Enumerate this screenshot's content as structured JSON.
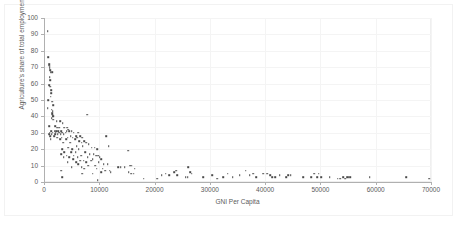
{
  "chart_data": {
    "type": "scatter",
    "title": "",
    "xlabel": "GNI Per Capita",
    "ylabel": "Agriculture's share of total employment",
    "xlim": [
      0,
      70000
    ],
    "ylim": [
      0,
      100
    ],
    "xticks": [
      0,
      10000,
      20000,
      30000,
      40000,
      50000,
      60000,
      70000
    ],
    "yticks": [
      0,
      10,
      20,
      30,
      40,
      50,
      60,
      70,
      80,
      90,
      100
    ],
    "xtick_labels": [
      "0",
      "10000",
      "20000",
      "30000",
      "40000",
      "50000",
      "60000",
      "70000"
    ],
    "ytick_labels": [
      "0",
      "10",
      "20",
      "30",
      "40",
      "50",
      "60",
      "70",
      "80",
      "90",
      "100"
    ],
    "grid": true,
    "legend": false,
    "marker_color": "#4a4a4a",
    "marker": "square",
    "series": [
      {
        "name": "Countries",
        "points": [
          [
            700,
            92
          ],
          [
            800,
            76
          ],
          [
            900,
            72
          ],
          [
            950,
            71
          ],
          [
            1000,
            70
          ],
          [
            1050,
            69
          ],
          [
            1100,
            68
          ],
          [
            1200,
            67
          ],
          [
            1500,
            67
          ],
          [
            1000,
            64
          ],
          [
            1100,
            62
          ],
          [
            900,
            59
          ],
          [
            1150,
            58
          ],
          [
            1250,
            56
          ],
          [
            1300,
            54
          ],
          [
            1200,
            52
          ],
          [
            800,
            50
          ],
          [
            1500,
            49
          ],
          [
            1700,
            47
          ],
          [
            700,
            45
          ],
          [
            1400,
            44
          ],
          [
            1600,
            43
          ],
          [
            1450,
            42
          ],
          [
            1500,
            41
          ],
          [
            1550,
            41
          ],
          [
            1600,
            40
          ],
          [
            1650,
            40
          ],
          [
            1400,
            39
          ],
          [
            1700,
            38
          ],
          [
            7800,
            41
          ],
          [
            2300,
            37
          ],
          [
            2900,
            37
          ],
          [
            3400,
            36
          ],
          [
            900,
            34
          ],
          [
            2000,
            34
          ],
          [
            2400,
            33
          ],
          [
            2800,
            33
          ],
          [
            3700,
            33
          ],
          [
            4200,
            33
          ],
          [
            4400,
            32
          ],
          [
            1300,
            31
          ],
          [
            1900,
            31
          ],
          [
            2200,
            31
          ],
          [
            2600,
            31
          ],
          [
            3100,
            31
          ],
          [
            4100,
            31
          ],
          [
            4600,
            31
          ],
          [
            5000,
            31
          ],
          [
            1000,
            30
          ],
          [
            1600,
            30
          ],
          [
            2100,
            30
          ],
          [
            2700,
            30
          ],
          [
            3300,
            30
          ],
          [
            3900,
            30
          ],
          [
            5400,
            30
          ],
          [
            6200,
            30
          ],
          [
            900,
            29
          ],
          [
            1400,
            29
          ],
          [
            2000,
            29
          ],
          [
            2500,
            29
          ],
          [
            3000,
            29
          ],
          [
            3600,
            29
          ],
          [
            4800,
            28
          ],
          [
            5800,
            28
          ],
          [
            6600,
            28
          ],
          [
            1100,
            28
          ],
          [
            1800,
            28
          ],
          [
            2400,
            27
          ],
          [
            3200,
            27
          ],
          [
            4300,
            27
          ],
          [
            5200,
            27
          ],
          [
            6000,
            27
          ],
          [
            6900,
            27
          ],
          [
            1200,
            26
          ],
          [
            2900,
            26
          ],
          [
            4000,
            26
          ],
          [
            5600,
            26
          ],
          [
            6400,
            25
          ],
          [
            11300,
            28
          ],
          [
            7300,
            25
          ],
          [
            3500,
            24
          ],
          [
            4700,
            24
          ],
          [
            6800,
            24
          ],
          [
            7600,
            24
          ],
          [
            8100,
            23
          ],
          [
            11700,
            22
          ],
          [
            7000,
            22
          ],
          [
            5900,
            22
          ],
          [
            4400,
            21
          ],
          [
            8600,
            21
          ],
          [
            9200,
            21
          ],
          [
            3300,
            20
          ],
          [
            5100,
            20
          ],
          [
            6300,
            20
          ],
          [
            9600,
            20
          ],
          [
            15200,
            19
          ],
          [
            3700,
            18
          ],
          [
            4900,
            18
          ],
          [
            5700,
            18
          ],
          [
            7400,
            18
          ],
          [
            8300,
            17
          ],
          [
            9000,
            17
          ],
          [
            9400,
            16
          ],
          [
            3100,
            17
          ],
          [
            4100,
            16
          ],
          [
            5400,
            16
          ],
          [
            6700,
            16
          ],
          [
            9800,
            16
          ],
          [
            10100,
            15
          ],
          [
            3600,
            15
          ],
          [
            4600,
            15
          ],
          [
            6100,
            15
          ],
          [
            7900,
            15
          ],
          [
            8800,
            14
          ],
          [
            10400,
            14
          ],
          [
            5300,
            14
          ],
          [
            6500,
            13
          ],
          [
            7200,
            13
          ],
          [
            8500,
            13
          ],
          [
            9900,
            12
          ],
          [
            4300,
            12
          ],
          [
            5800,
            12
          ],
          [
            7600,
            12
          ],
          [
            10800,
            11
          ],
          [
            11500,
            11
          ],
          [
            6200,
            11
          ],
          [
            8000,
            10
          ],
          [
            9300,
            10
          ],
          [
            13400,
            9
          ],
          [
            13900,
            9
          ],
          [
            14600,
            9
          ],
          [
            15600,
            10
          ],
          [
            15900,
            10
          ],
          [
            16400,
            8
          ],
          [
            5000,
            9
          ],
          [
            6800,
            9
          ],
          [
            7300,
            8
          ],
          [
            9500,
            8
          ],
          [
            10600,
            8
          ],
          [
            11100,
            7
          ],
          [
            11900,
            7
          ],
          [
            15300,
            6
          ],
          [
            15800,
            5
          ],
          [
            16200,
            5
          ],
          [
            3100,
            7
          ],
          [
            3300,
            3
          ],
          [
            6900,
            5
          ],
          [
            8800,
            5
          ],
          [
            10300,
            6
          ],
          [
            12100,
            6
          ],
          [
            9700,
            1
          ],
          [
            18000,
            2
          ],
          [
            20500,
            2
          ],
          [
            21300,
            4
          ],
          [
            22000,
            5
          ],
          [
            22600,
            4
          ],
          [
            23500,
            6
          ],
          [
            24100,
            4
          ],
          [
            23900,
            7
          ],
          [
            26100,
            9
          ],
          [
            26400,
            6
          ],
          [
            26700,
            5
          ],
          [
            26000,
            3
          ],
          [
            25600,
            3
          ],
          [
            28800,
            3
          ],
          [
            30400,
            4
          ],
          [
            31300,
            2
          ],
          [
            32400,
            3
          ],
          [
            33200,
            5
          ],
          [
            34100,
            3
          ],
          [
            35400,
            4
          ],
          [
            36500,
            7
          ],
          [
            37200,
            4
          ],
          [
            37800,
            5
          ],
          [
            38400,
            3
          ],
          [
            39600,
            5
          ],
          [
            40400,
            5
          ],
          [
            40900,
            4
          ],
          [
            41300,
            3
          ],
          [
            41800,
            3
          ],
          [
            42600,
            4
          ],
          [
            43800,
            3
          ],
          [
            44200,
            4
          ],
          [
            44600,
            4
          ],
          [
            46900,
            3
          ],
          [
            48300,
            3
          ],
          [
            48900,
            5
          ],
          [
            49400,
            3
          ],
          [
            49700,
            5
          ],
          [
            50100,
            3
          ],
          [
            51700,
            3
          ],
          [
            53100,
            2
          ],
          [
            53600,
            2
          ],
          [
            54100,
            3
          ],
          [
            54500,
            2
          ],
          [
            54800,
            3
          ],
          [
            55100,
            3
          ],
          [
            55400,
            3
          ],
          [
            58900,
            3
          ],
          [
            65500,
            3
          ],
          [
            69700,
            2
          ]
        ]
      }
    ]
  }
}
